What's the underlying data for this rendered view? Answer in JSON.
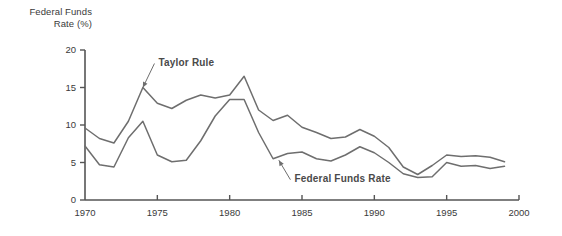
{
  "chart_data": {
    "type": "line",
    "title": "",
    "ylabel": "Federal Funds Rate (%)",
    "ylabel_line1": "Federal Funds",
    "ylabel_line2": "Rate (%)",
    "xlabel": "",
    "xlim": [
      1970,
      2000
    ],
    "ylim": [
      0,
      20
    ],
    "xticks": [
      1970,
      1975,
      1980,
      1985,
      1990,
      1995,
      2000
    ],
    "xtick_labels": [
      "1970",
      "1975",
      "1980",
      "1985",
      "1990",
      "1995",
      "2000"
    ],
    "yticks": [
      0,
      5,
      10,
      15,
      20
    ],
    "ytick_labels": [
      "0",
      "5",
      "10",
      "15",
      "20"
    ],
    "grid": false,
    "legend_position": "inline-annotations",
    "line_color": "#6e6e6e",
    "x": [
      1970,
      1971,
      1972,
      1973,
      1974,
      1975,
      1976,
      1977,
      1978,
      1979,
      1980,
      1981,
      1982,
      1983,
      1984,
      1985,
      1986,
      1987,
      1988,
      1989,
      1990,
      1991,
      1992,
      1993,
      1994,
      1995,
      1996,
      1997,
      1998,
      1999
    ],
    "series": [
      {
        "name": "Taylor Rule",
        "label": "Taylor Rule",
        "values": [
          9.6,
          8.2,
          7.6,
          10.5,
          15.0,
          12.9,
          12.2,
          13.3,
          14.0,
          13.6,
          14.0,
          16.5,
          12.0,
          10.6,
          11.3,
          9.7,
          9.0,
          8.2,
          8.4,
          9.4,
          8.5,
          7.0,
          4.4,
          3.4,
          4.6,
          6.0,
          5.8,
          5.9,
          5.7,
          5.1
        ]
      },
      {
        "name": "Federal Funds Rate",
        "label": "Federal Funds Rate",
        "values": [
          7.2,
          4.7,
          4.4,
          8.3,
          10.5,
          6.0,
          5.1,
          5.3,
          7.9,
          11.2,
          13.4,
          13.4,
          9.0,
          5.5,
          6.2,
          6.4,
          5.5,
          5.2,
          6.0,
          7.1,
          6.3,
          5.0,
          3.5,
          3.0,
          3.1,
          5.0,
          4.5,
          4.6,
          4.2,
          4.5
        ]
      }
    ],
    "annotations": [
      {
        "text": "Taylor Rule",
        "target_x": 1974,
        "target_y": 15.0,
        "label_x": 1974.8,
        "label_y": 18.2
      },
      {
        "text": "Federal Funds Rate",
        "target_x": 1983.4,
        "target_y": 5.3,
        "label_x": 1984.2,
        "label_y": 2.7
      }
    ]
  }
}
